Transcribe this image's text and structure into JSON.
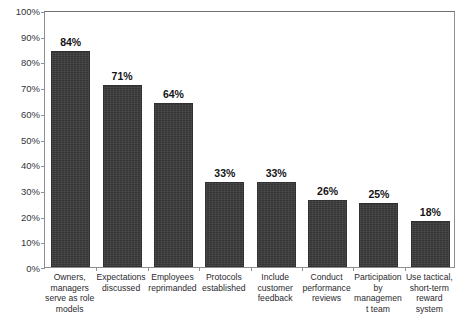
{
  "chart_data": {
    "type": "bar",
    "title": "",
    "xlabel": "",
    "ylabel": "",
    "ylim": [
      0,
      100
    ],
    "ytick_labels": [
      "100%",
      "90%",
      "80%",
      "70%",
      "60%",
      "50%",
      "40%",
      "30%",
      "20%",
      "10%",
      "0%"
    ],
    "ytick_values": [
      100,
      90,
      80,
      70,
      60,
      50,
      40,
      30,
      20,
      10,
      0
    ],
    "grid": false,
    "legend": false,
    "categories": [
      "Owners, managers serve as role models",
      "Expectations discussed",
      "Employees reprimanded",
      "Protocols established",
      "Include customer feedback",
      "Conduct performance reviews",
      "Participation by management team",
      "Use tactical, short-term reward system"
    ],
    "values": [
      84,
      71,
      64,
      33,
      33,
      26,
      25,
      18
    ],
    "value_labels": [
      "84%",
      "71%",
      "64%",
      "33%",
      "33%",
      "26%",
      "25%",
      "18%"
    ],
    "bar_color": "#3b3b3d",
    "axis_color": "#8e8e93",
    "text_color": "#2a2a2e"
  },
  "figure": {
    "title_faint": ""
  }
}
